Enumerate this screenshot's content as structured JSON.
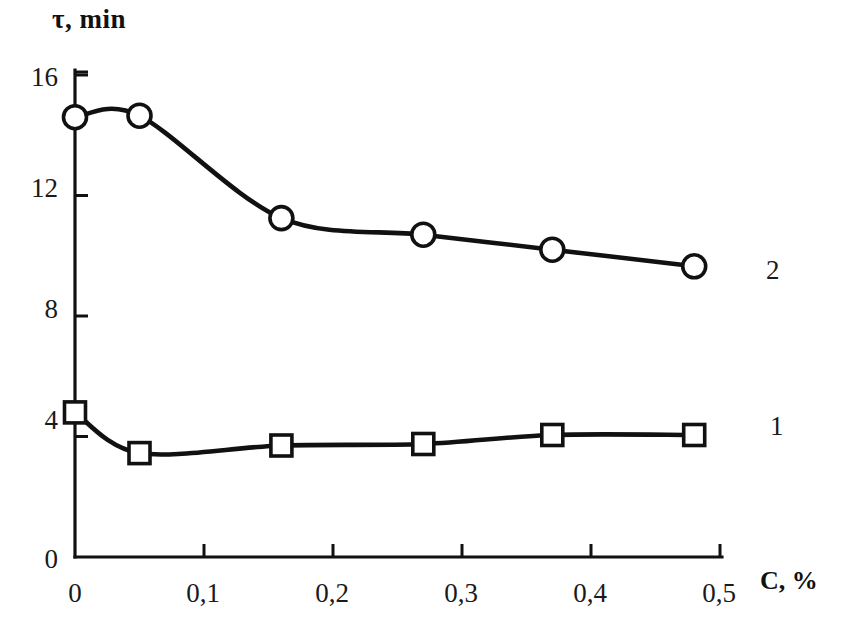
{
  "chart_data": {
    "type": "line",
    "title": "",
    "xlabel": "C, %",
    "ylabel": "τ, min",
    "xlim": [
      0,
      0.5
    ],
    "ylim": [
      0,
      16
    ],
    "grid": false,
    "legend_position": "right-inline",
    "x_tick_labels": [
      "0",
      "0,1",
      "0,2",
      "0,3",
      "0,4",
      "0,5"
    ],
    "x_tick_values": [
      0,
      0.1,
      0.2,
      0.3,
      0.4,
      0.5
    ],
    "y_tick_labels": [
      "0",
      "4",
      "8",
      "12",
      "16"
    ],
    "y_tick_values": [
      0,
      4,
      8,
      12,
      16
    ],
    "series": [
      {
        "name": "1",
        "marker": "square",
        "x": [
          0,
          0.05,
          0.16,
          0.27,
          0.37,
          0.48
        ],
        "values": [
          4.8,
          3.45,
          3.7,
          3.75,
          4.05,
          4.05
        ]
      },
      {
        "name": "2",
        "marker": "circle",
        "x": [
          0,
          0.05,
          0.16,
          0.27,
          0.37,
          0.48
        ],
        "values": [
          14.6,
          14.65,
          11.25,
          10.7,
          10.2,
          9.65
        ]
      }
    ],
    "annotations": [
      {
        "text": "2",
        "x": 0.5,
        "y": 10.0
      },
      {
        "text": "1",
        "x": 0.5,
        "y": 4.4
      }
    ]
  },
  "axes": {
    "y_title": "τ, min",
    "x_title": "C, %"
  },
  "caption": "",
  "colors": {
    "line": "#111111",
    "marker_fill": "#ffffff",
    "axis": "#111111",
    "background": "#ffffff"
  }
}
